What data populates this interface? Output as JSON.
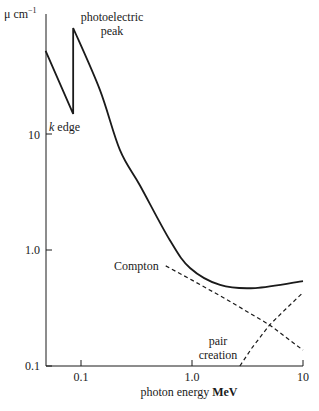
{
  "chart_data": {
    "type": "line",
    "title": "",
    "xlabel": "photon energy MeV",
    "xlabel_plain": "photon energy",
    "xlabel_unit": "MeV",
    "ylabel": "μ cm⁻¹",
    "ylabel_symbol": "μ",
    "ylabel_unit": "cm",
    "ylabel_exp": "−1",
    "xscale": "log",
    "yscale": "log",
    "xlim": [
      0.048,
      10
    ],
    "ylim": [
      0.1,
      130
    ],
    "x_ticks": [
      {
        "value": 0.1,
        "label": "0.1"
      },
      {
        "value": 1.0,
        "label": "1.0"
      },
      {
        "value": 10,
        "label": "10"
      }
    ],
    "y_ticks": [
      {
        "value": 0.1,
        "label": "0.1"
      },
      {
        "value": 1.0,
        "label": "1.0"
      },
      {
        "value": 10,
        "label": "10"
      }
    ],
    "grid": false,
    "legend": null,
    "series": [
      {
        "name": "total attenuation",
        "style": "solid",
        "x": [
          0.048,
          0.085,
          0.085,
          0.148,
          0.224,
          0.34,
          0.63,
          0.96,
          1.79,
          3.7,
          10
        ],
        "y": [
          52,
          14.9,
          82,
          24,
          7.3,
          3.6,
          1.22,
          0.7,
          0.5,
          0.47,
          0.54
        ]
      },
      {
        "name": "Compton",
        "style": "dashed",
        "x": [
          0.58,
          1.0,
          2.0,
          5.0,
          10
        ],
        "y": [
          0.73,
          0.55,
          0.38,
          0.226,
          0.137
        ]
      },
      {
        "name": "pair creation",
        "style": "dashed",
        "x": [
          2.7,
          3.5,
          5.0,
          7.0,
          10
        ],
        "y": [
          0.1,
          0.145,
          0.226,
          0.31,
          0.43
        ]
      }
    ],
    "annotations": [
      {
        "text": "photoelectric peak",
        "lines": [
          "photoelectric",
          "peak"
        ],
        "x": 0.085,
        "y": 82
      },
      {
        "text": "k edge",
        "italic_part": "k",
        "rest": "edge",
        "x": 0.085,
        "y": 14.9
      },
      {
        "text": "Compton",
        "x": 0.58,
        "y": 0.73
      },
      {
        "text": "pair creation",
        "lines": [
          "pair",
          "creation"
        ],
        "x": 2.7,
        "y": 0.15
      }
    ]
  },
  "labels": {
    "photo_line1": "photoelectric",
    "photo_line2": "peak",
    "k_italic": "k",
    "k_rest": " edge",
    "compton": "Compton",
    "pair_line1": "pair",
    "pair_line2": "creation"
  }
}
